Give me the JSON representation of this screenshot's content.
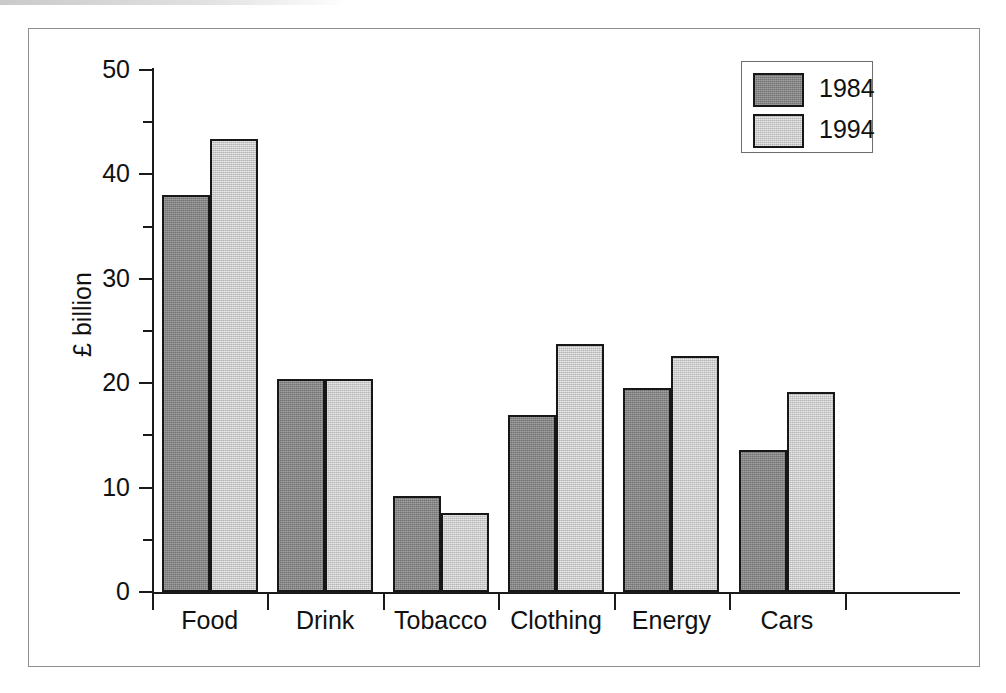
{
  "figure": {
    "frame": true,
    "background": "#ffffff"
  },
  "chart_data": {
    "type": "bar",
    "title": "",
    "xlabel": "",
    "ylabel": "£ billion",
    "ylim": [
      0,
      50
    ],
    "ytick_labels": [
      "0",
      "10",
      "20",
      "30",
      "40",
      "50"
    ],
    "ytick_values": [
      0,
      10,
      20,
      30,
      40,
      50
    ],
    "yminor_values": [
      5,
      15,
      25,
      35,
      45
    ],
    "grid": false,
    "legend_position": "top-right",
    "categories": [
      "Food",
      "Drink",
      "Tobacco",
      "Clothing",
      "Energy",
      "Cars"
    ],
    "series": [
      {
        "name": "1984",
        "color": "#8c8c8c",
        "values": [
          38.0,
          20.4,
          9.2,
          17.0,
          19.5,
          13.6
        ]
      },
      {
        "name": "1994",
        "color": "#cdcdcd",
        "values": [
          43.4,
          20.4,
          7.6,
          23.8,
          22.6,
          19.2
        ]
      }
    ]
  },
  "legend": {
    "entries": [
      {
        "label": "1984",
        "color": "#8c8c8c"
      },
      {
        "label": "1994",
        "color": "#cdcdcd"
      }
    ]
  }
}
